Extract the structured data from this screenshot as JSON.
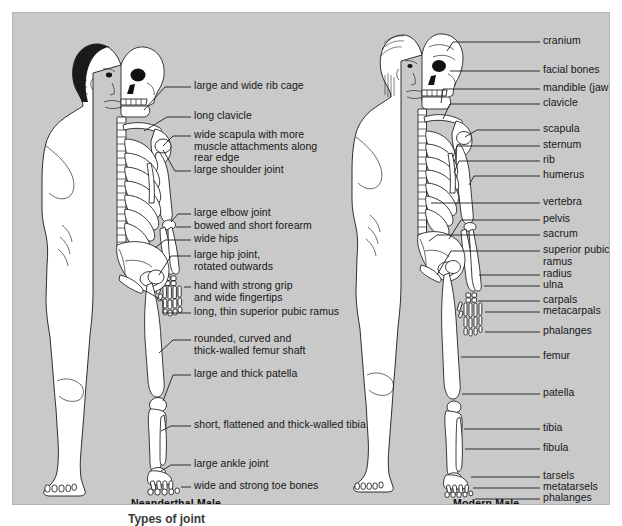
{
  "figure": {
    "title_cut_off": "Types of joint",
    "background_color": "#c9c9c9",
    "ink_color": "#161616"
  },
  "left_figure": {
    "caption": "Neanderthal Male",
    "labels": [
      {
        "id": "rib-cage",
        "text": "large and wide rib cage",
        "x": 181,
        "y": 74
      },
      {
        "id": "clavicle",
        "text": "long clavicle",
        "x": 181,
        "y": 104
      },
      {
        "id": "scapula",
        "text": "wide scapula with more\nmuscle attachments along\nrear edge",
        "x": 181,
        "y": 123
      },
      {
        "id": "shoulder-joint",
        "text": "large shoulder joint",
        "x": 181,
        "y": 158
      },
      {
        "id": "elbow-joint",
        "text": "large elbow joint",
        "x": 181,
        "y": 201
      },
      {
        "id": "forearm",
        "text": "bowed and short forearm",
        "x": 181,
        "y": 214
      },
      {
        "id": "wide-hips",
        "text": "wide hips",
        "x": 181,
        "y": 227
      },
      {
        "id": "hip-joint",
        "text": "large hip joint,\nrotated outwards",
        "x": 181,
        "y": 243
      },
      {
        "id": "hand",
        "text": "hand with strong grip\nand wide fingertips",
        "x": 181,
        "y": 274
      },
      {
        "id": "pubic-ramus",
        "text": "long, thin superior pubic ramus",
        "x": 181,
        "y": 300
      },
      {
        "id": "femur-shaft",
        "text": "rounded, curved and\nthick-walled femur shaft",
        "x": 181,
        "y": 327
      },
      {
        "id": "patella",
        "text": "large and thick patella",
        "x": 181,
        "y": 362
      },
      {
        "id": "tibia",
        "text": "short, flattened and thick-walled tibia",
        "x": 181,
        "y": 413
      },
      {
        "id": "ankle-joint",
        "text": "large ankle joint",
        "x": 181,
        "y": 452
      },
      {
        "id": "toe-bones",
        "text": "wide and strong toe bones",
        "x": 181,
        "y": 474
      }
    ]
  },
  "right_figure": {
    "caption": "Modern Male",
    "labels": [
      {
        "id": "cranium",
        "text": "cranium",
        "x": 530,
        "y": 29
      },
      {
        "id": "facial-bones",
        "text": "facial bones",
        "x": 530,
        "y": 58
      },
      {
        "id": "mandible",
        "text": "mandible (jaw)",
        "x": 530,
        "y": 76
      },
      {
        "id": "clavicle",
        "text": "clavicle",
        "x": 530,
        "y": 91
      },
      {
        "id": "scapula",
        "text": "scapula",
        "x": 530,
        "y": 117
      },
      {
        "id": "sternum",
        "text": "sternum",
        "x": 530,
        "y": 133
      },
      {
        "id": "rib",
        "text": "rib",
        "x": 530,
        "y": 148
      },
      {
        "id": "humerus",
        "text": "humerus",
        "x": 530,
        "y": 163
      },
      {
        "id": "vertebra",
        "text": "vertebra",
        "x": 530,
        "y": 190
      },
      {
        "id": "pelvis",
        "text": "pelvis",
        "x": 530,
        "y": 207
      },
      {
        "id": "sacrum",
        "text": "sacrum",
        "x": 530,
        "y": 222
      },
      {
        "id": "superior-pubic-ramus",
        "text": "superior pubic\nramus",
        "x": 530,
        "y": 238
      },
      {
        "id": "radius",
        "text": "radius",
        "x": 530,
        "y": 262
      },
      {
        "id": "ulna",
        "text": "ulna",
        "x": 530,
        "y": 273
      },
      {
        "id": "carpals",
        "text": "carpals",
        "x": 530,
        "y": 288
      },
      {
        "id": "metacarpals",
        "text": "metacarpals",
        "x": 530,
        "y": 299
      },
      {
        "id": "phalanges-hand",
        "text": "phalanges",
        "x": 530,
        "y": 319
      },
      {
        "id": "femur",
        "text": "femur",
        "x": 530,
        "y": 344
      },
      {
        "id": "patella",
        "text": "patella",
        "x": 530,
        "y": 381
      },
      {
        "id": "tibia",
        "text": "tibia",
        "x": 530,
        "y": 416
      },
      {
        "id": "fibula",
        "text": "fibula",
        "x": 530,
        "y": 436
      },
      {
        "id": "tarsels",
        "text": "tarsels",
        "x": 530,
        "y": 464
      },
      {
        "id": "metatarsels",
        "text": "metatarsels",
        "x": 530,
        "y": 475
      },
      {
        "id": "phalanges-foot",
        "text": "phalanges",
        "x": 530,
        "y": 486
      }
    ]
  }
}
